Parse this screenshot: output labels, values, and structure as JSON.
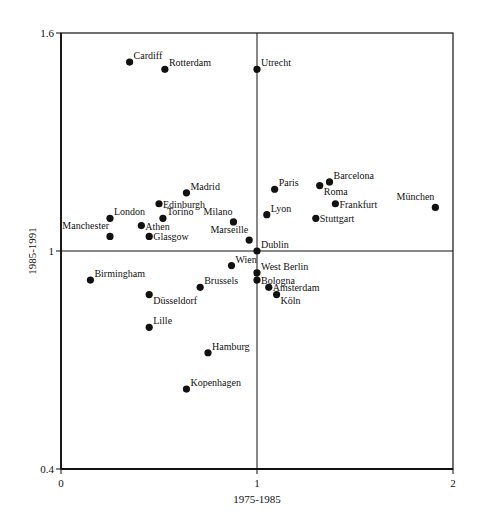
{
  "chart_data": {
    "type": "scatter",
    "title": "",
    "xlabel": "1975-1985",
    "ylabel": "1985-1991",
    "xlim": [
      0,
      2
    ],
    "ylim": [
      0.4,
      1.6
    ],
    "x_ticks": [
      "0",
      "1",
      "2"
    ],
    "y_ticks": [
      "0.4",
      "1",
      "1.6"
    ],
    "reference_lines": {
      "x": 1,
      "y": 1
    },
    "grid": false,
    "legend": null,
    "points": [
      {
        "label": "Cardiff",
        "x": 0.35,
        "y": 1.52,
        "pos": "ne"
      },
      {
        "label": "Rotterdam",
        "x": 0.53,
        "y": 1.5,
        "pos": "ne"
      },
      {
        "label": "Utrecht",
        "x": 1.0,
        "y": 1.5,
        "pos": "ne"
      },
      {
        "label": "Madrid",
        "x": 0.64,
        "y": 1.16,
        "pos": "ne"
      },
      {
        "label": "Edinburgh",
        "x": 0.5,
        "y": 1.13,
        "pos": "e"
      },
      {
        "label": "London",
        "x": 0.25,
        "y": 1.09,
        "pos": "ne"
      },
      {
        "label": "Torino",
        "x": 0.52,
        "y": 1.09,
        "pos": "ne"
      },
      {
        "label": "Milano",
        "x": 0.88,
        "y": 1.08,
        "pos": "nw"
      },
      {
        "label": "Athen",
        "x": 0.41,
        "y": 1.07,
        "pos": "e"
      },
      {
        "label": "Manchester",
        "x": 0.25,
        "y": 1.04,
        "pos": "nw"
      },
      {
        "label": "Glasgow",
        "x": 0.45,
        "y": 1.04,
        "pos": "e"
      },
      {
        "label": "Marseille",
        "x": 0.96,
        "y": 1.03,
        "pos": "nw"
      },
      {
        "label": "Paris",
        "x": 1.09,
        "y": 1.17,
        "pos": "ne"
      },
      {
        "label": "Barcelona",
        "x": 1.37,
        "y": 1.19,
        "pos": "ne"
      },
      {
        "label": "Roma",
        "x": 1.32,
        "y": 1.18,
        "pos": "se"
      },
      {
        "label": "Frankfurt",
        "x": 1.4,
        "y": 1.13,
        "pos": "e"
      },
      {
        "label": "Lyon",
        "x": 1.05,
        "y": 1.1,
        "pos": "ne"
      },
      {
        "label": "Stuttgart",
        "x": 1.3,
        "y": 1.09,
        "pos": "e"
      },
      {
        "label": "München",
        "x": 1.91,
        "y": 1.12,
        "pos": "nw"
      },
      {
        "label": "Dublin",
        "x": 1.0,
        "y": 1.0,
        "pos": "ne"
      },
      {
        "label": "Birmingham",
        "x": 0.15,
        "y": 0.92,
        "pos": "ne"
      },
      {
        "label": "Wien",
        "x": 0.87,
        "y": 0.96,
        "pos": "ne"
      },
      {
        "label": "Brussels",
        "x": 0.71,
        "y": 0.9,
        "pos": "ne"
      },
      {
        "label": "Düsseldorf",
        "x": 0.45,
        "y": 0.88,
        "pos": "se"
      },
      {
        "label": "Lille",
        "x": 0.45,
        "y": 0.79,
        "pos": "ne"
      },
      {
        "label": "West Berlin",
        "x": 1.0,
        "y": 0.94,
        "pos": "ne"
      },
      {
        "label": "Bologna",
        "x": 1.0,
        "y": 0.92,
        "pos": "e"
      },
      {
        "label": "Amsterdam",
        "x": 1.06,
        "y": 0.9,
        "pos": "e"
      },
      {
        "label": "Köln",
        "x": 1.1,
        "y": 0.88,
        "pos": "se"
      },
      {
        "label": "Hamburg",
        "x": 0.75,
        "y": 0.72,
        "pos": "ne"
      },
      {
        "label": "Kopenhagen",
        "x": 0.64,
        "y": 0.62,
        "pos": "ne"
      }
    ]
  },
  "style": {
    "ink": "#111111",
    "background": "#ffffff"
  }
}
